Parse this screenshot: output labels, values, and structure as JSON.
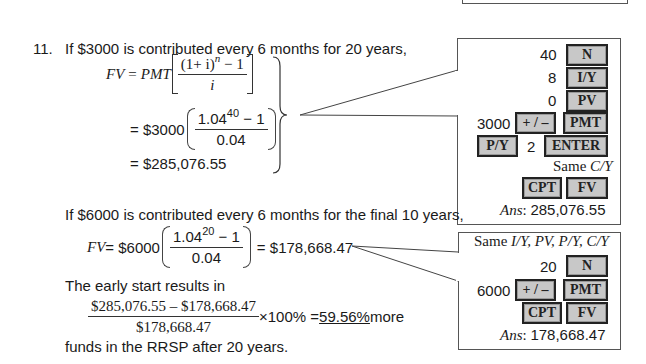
{
  "problem": {
    "number": "11.",
    "intro": "If $3000 is contributed every 6 months for 20 years,",
    "formula": {
      "lhs": "FV",
      "eq": "=",
      "pmt": "PMT",
      "numerator": "(1+ i)",
      "numerator_exp": "n",
      "numerator_tail": " − 1",
      "denominator": "i"
    },
    "step1": {
      "prefix": "= $3000",
      "numerator_base": "1.04",
      "numerator_exp": "40",
      "numerator_tail": " − 1",
      "denominator": "0.04"
    },
    "step2": "= $285,076.55",
    "intro2": "If $6000 is contributed every 6 months for the final 10 years,",
    "fv2": {
      "prefix": "FV",
      "eq_amount": " = $6000",
      "numerator_base": "1.04",
      "numerator_exp": "20",
      "numerator_tail": " − 1",
      "denominator": "0.04",
      "result": "= $178,668.47"
    },
    "comparison": {
      "intro": "The early start results in",
      "numerator": "$285,076.55 – $178,668.47",
      "denominator": "$178,668.47",
      "multiplier": "×100% = ",
      "result": "59.56%",
      "suffix": " more",
      "conclusion": "funds in the RRSP after 20 years."
    }
  },
  "calc1": {
    "n_val": "40",
    "n_key": "N",
    "iy_val": "8",
    "iy_key": "I/Y",
    "pv_val": "0",
    "pv_key": "PV",
    "pmt_val": "3000",
    "sign_key": "+ / –",
    "pmt_key": "PMT",
    "py_key": "P/Y",
    "py_val": "2",
    "enter_key": "ENTER",
    "same_label": "Same ",
    "same_items": "C/Y",
    "cpt_key": "CPT",
    "fv_key": "FV",
    "ans_label": "Ans",
    "ans_sep": ":  ",
    "ans_val": "285,076.55"
  },
  "calc2": {
    "same_label": "Same ",
    "same_items": "I/Y, PV, P/Y, C/Y",
    "n_val": "20",
    "n_key": "N",
    "pmt_val": "6000",
    "sign_key": "+ / –",
    "pmt_key": "PMT",
    "cpt_key": "CPT",
    "fv_key": "FV",
    "ans_label": "Ans",
    "ans_sep": ":  ",
    "ans_val": "178,668.47"
  }
}
